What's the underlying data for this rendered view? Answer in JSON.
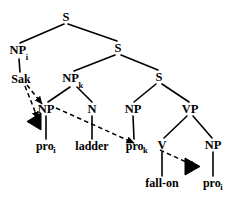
{
  "figure": {
    "kind": "syntax-tree",
    "stroke_color": "#000000",
    "background_color": "#ffffff",
    "width": 236,
    "height": 197
  },
  "nodes": [
    {
      "id": "s-root",
      "label": "S",
      "subscript": "",
      "x": 66,
      "y": 17
    },
    {
      "id": "np-i",
      "label": "NP",
      "subscript": "i",
      "x": 19,
      "y": 51
    },
    {
      "id": "s-mid",
      "label": "S",
      "subscript": "",
      "x": 118,
      "y": 48
    },
    {
      "id": "np-k",
      "label": "NP",
      "subscript": "k",
      "x": 73,
      "y": 79
    },
    {
      "id": "s-low",
      "label": "S",
      "subscript": "",
      "x": 159,
      "y": 77
    },
    {
      "id": "np-left",
      "label": "NP",
      "subscript": "",
      "x": 46,
      "y": 109
    },
    {
      "id": "n",
      "label": "N",
      "subscript": "",
      "x": 92,
      "y": 109
    },
    {
      "id": "np-obj",
      "label": "NP",
      "subscript": "",
      "x": 133,
      "y": 109
    },
    {
      "id": "vp",
      "label": "VP",
      "subscript": "",
      "x": 190,
      "y": 109
    },
    {
      "id": "v",
      "label": "V",
      "subscript": "",
      "x": 162,
      "y": 145
    },
    {
      "id": "np-last",
      "label": "NP",
      "subscript": "",
      "x": 213,
      "y": 145
    }
  ],
  "leaves": [
    {
      "id": "sak",
      "label": "Sak",
      "subscript": "",
      "x": 21,
      "y": 79
    },
    {
      "id": "pro-i-1",
      "label": "pro",
      "subscript": "i",
      "x": 46,
      "y": 146
    },
    {
      "id": "ladder",
      "label": "ladder",
      "subscript": "",
      "x": 92,
      "y": 146
    },
    {
      "id": "pro-k",
      "label": "pro",
      "subscript": "k",
      "x": 137,
      "y": 146
    },
    {
      "id": "fall-on",
      "label": "fall-on",
      "subscript": "",
      "x": 162,
      "y": 183
    },
    {
      "id": "pro-i-2",
      "label": "pro",
      "subscript": "i",
      "x": 213,
      "y": 183
    }
  ],
  "branches": [
    {
      "from": "s-root",
      "to": "np-i",
      "x1": 64,
      "y1": 24,
      "x2": 20,
      "y2": 43
    },
    {
      "from": "s-root",
      "to": "s-mid",
      "x1": 68,
      "y1": 24,
      "x2": 117,
      "y2": 41
    },
    {
      "from": "np-i",
      "to": "sak",
      "x1": 19,
      "y1": 59,
      "x2": 20,
      "y2": 72
    },
    {
      "from": "s-mid",
      "to": "np-k",
      "x1": 115,
      "y1": 55,
      "x2": 74,
      "y2": 71
    },
    {
      "from": "s-mid",
      "to": "s-low",
      "x1": 121,
      "y1": 55,
      "x2": 158,
      "y2": 70
    },
    {
      "from": "np-k",
      "to": "np-left",
      "x1": 70,
      "y1": 87,
      "x2": 48,
      "y2": 102
    },
    {
      "from": "np-k",
      "to": "n",
      "x1": 77,
      "y1": 87,
      "x2": 92,
      "y2": 102
    },
    {
      "from": "s-low",
      "to": "np-obj",
      "x1": 156,
      "y1": 84,
      "x2": 134,
      "y2": 102
    },
    {
      "from": "s-low",
      "to": "vp",
      "x1": 162,
      "y1": 84,
      "x2": 189,
      "y2": 102
    },
    {
      "from": "np-left",
      "to": "pro-i-1",
      "x1": 46,
      "y1": 116,
      "x2": 46,
      "y2": 139
    },
    {
      "from": "n",
      "to": "ladder",
      "x1": 92,
      "y1": 116,
      "x2": 92,
      "y2": 139
    },
    {
      "from": "np-obj",
      "to": "pro-k",
      "x1": 133,
      "y1": 116,
      "x2": 134,
      "y2": 139
    },
    {
      "from": "vp",
      "to": "v",
      "x1": 187,
      "y1": 116,
      "x2": 164,
      "y2": 138
    },
    {
      "from": "vp",
      "to": "np-last",
      "x1": 193,
      "y1": 116,
      "x2": 212,
      "y2": 138
    },
    {
      "from": "v",
      "to": "fall-on",
      "x1": 162,
      "y1": 152,
      "x2": 162,
      "y2": 176
    },
    {
      "from": "np-last",
      "to": "pro-i-2",
      "x1": 213,
      "y1": 152,
      "x2": 213,
      "y2": 176
    }
  ],
  "dashed_links": [
    {
      "id": "sak-to-np-left",
      "from": "sak",
      "to": "np-left",
      "x1": 27,
      "y1": 85,
      "x2": 42,
      "y2": 104,
      "arrow": "to"
    },
    {
      "id": "sak-to-triangle",
      "from": "sak",
      "to": "triangle-left",
      "x1": 25,
      "y1": 86,
      "x2": 38,
      "y2": 119,
      "arrow": "to"
    },
    {
      "id": "np-left-to-pro-k",
      "from": "np-left",
      "to": "pro-k",
      "x1": 56,
      "y1": 108,
      "x2": 134,
      "y2": 143,
      "arrow": "to"
    },
    {
      "id": "v-to-triangle",
      "from": "v",
      "to": "triangle-right",
      "x1": 160,
      "y1": 150,
      "x2": 197,
      "y2": 167,
      "arrow": "to"
    }
  ],
  "triangles": [
    {
      "id": "triangle-left",
      "direction": "left",
      "apex_x": 27,
      "apex_y": 122,
      "x": 27,
      "y": 113,
      "w": 14,
      "h": 17
    },
    {
      "id": "triangle-right",
      "direction": "right",
      "apex_x": 200,
      "apex_y": 167,
      "x": 185,
      "y": 158,
      "w": 15,
      "h": 17
    }
  ]
}
